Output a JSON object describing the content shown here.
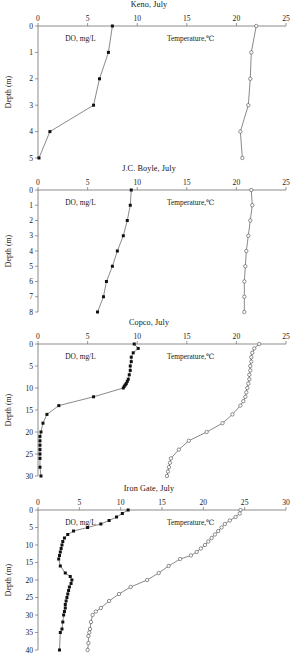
{
  "figure": {
    "series_labels": {
      "do": "DO, mg/L",
      "temperature": "Temperature,℃"
    },
    "y_axis_title": "Depth (m)"
  },
  "chart_data": [
    {
      "type": "line",
      "title": "Keno, July",
      "xlabel": "",
      "ylabel": "Depth (m)",
      "xlim": [
        0,
        25
      ],
      "ylim": [
        0,
        5
      ],
      "xticks": [
        0,
        5,
        10,
        15,
        20,
        25
      ],
      "yticks": [
        0,
        1,
        2,
        3,
        4,
        5
      ],
      "grid": false,
      "legend": "inline",
      "series": [
        {
          "name": "DO, mg/L",
          "marker": "filled-square",
          "x": [
            7.5,
            7.1,
            6.2,
            5.6,
            1.2,
            0.1
          ],
          "y": [
            0,
            1,
            2,
            3,
            4,
            5
          ]
        },
        {
          "name": "Temperature,℃",
          "marker": "open-circle",
          "x": [
            22.0,
            21.5,
            21.4,
            21.2,
            20.4,
            20.6
          ],
          "y": [
            0,
            1,
            2,
            3,
            4,
            5
          ]
        }
      ]
    },
    {
      "type": "line",
      "title": "J.C. Boyle, July",
      "xlabel": "",
      "ylabel": "Depth (m)",
      "xlim": [
        0,
        25
      ],
      "ylim": [
        0,
        8
      ],
      "xticks": [
        0,
        5,
        10,
        15,
        20,
        25
      ],
      "yticks": [
        0,
        1,
        2,
        3,
        4,
        5,
        6,
        7,
        8
      ],
      "grid": false,
      "legend": "inline",
      "series": [
        {
          "name": "DO, mg/L",
          "marker": "filled-square",
          "x": [
            9.4,
            9.3,
            9.0,
            8.6,
            8.0,
            7.5,
            6.9,
            6.6,
            6.0
          ],
          "y": [
            0,
            1,
            2,
            3,
            4,
            5,
            6,
            7,
            8
          ]
        },
        {
          "name": "Temperature,℃",
          "marker": "open-circle",
          "x": [
            21.5,
            21.6,
            21.4,
            21.2,
            21.0,
            20.9,
            20.8,
            20.8,
            20.8
          ],
          "y": [
            0,
            1,
            2,
            3,
            4,
            5,
            6,
            7,
            8
          ]
        }
      ]
    },
    {
      "type": "line",
      "title": "Copco, July",
      "xlabel": "",
      "ylabel": "Depth (m)",
      "xlim": [
        0,
        25
      ],
      "ylim": [
        0,
        30
      ],
      "xticks": [
        0,
        5,
        10,
        15,
        20,
        25
      ],
      "yticks": [
        0,
        5,
        10,
        15,
        20,
        25,
        30
      ],
      "grid": false,
      "legend": "inline",
      "series": [
        {
          "name": "DO, mg/L",
          "marker": "filled-square",
          "x": [
            9.7,
            10.1,
            9.6,
            9.4,
            9.4,
            9.3,
            9.3,
            9.2,
            9.1,
            9.0,
            8.9,
            8.8,
            8.7,
            8.6,
            5.6,
            2.1,
            0.9,
            0.5,
            0.3,
            0.2,
            0.2,
            0.2,
            0.2,
            0.2,
            0.2,
            0.2,
            0.3
          ],
          "y": [
            0,
            1,
            2,
            3,
            4,
            5,
            6,
            7,
            8,
            8.5,
            9,
            9.3,
            9.6,
            10,
            12,
            14,
            16,
            18,
            20,
            21,
            22,
            23,
            24,
            25,
            26,
            28,
            30
          ]
        },
        {
          "name": "Temperature,℃",
          "marker": "open-circle",
          "x": [
            22.3,
            21.8,
            21.6,
            21.5,
            21.5,
            21.4,
            21.4,
            21.3,
            21.3,
            21.2,
            21.1,
            21.0,
            20.9,
            20.7,
            20.4,
            19.6,
            18.6,
            17.0,
            15.2,
            14.2,
            13.4,
            13.3,
            13.2,
            13.1,
            13.0
          ],
          "y": [
            0,
            1,
            2,
            3,
            4,
            5,
            6,
            7,
            8,
            9,
            10,
            11,
            12,
            13,
            14,
            16,
            18,
            20,
            22,
            24,
            26,
            27,
            28,
            29,
            30
          ]
        }
      ]
    },
    {
      "type": "line",
      "title": "Iron Gate, July",
      "xlabel": "",
      "ylabel": "Depth (m)",
      "xlim": [
        0,
        30
      ],
      "ylim": [
        0,
        40
      ],
      "xticks": [
        0,
        5,
        10,
        15,
        20,
        25,
        30
      ],
      "yticks": [
        0,
        5,
        10,
        15,
        20,
        25,
        30,
        35,
        40
      ],
      "grid": false,
      "legend": "inline",
      "series": [
        {
          "name": "DO, mg/L",
          "marker": "filled-square",
          "x": [
            10.9,
            10.2,
            9.5,
            8.6,
            7.6,
            6.0,
            4.3,
            3.6,
            3.2,
            3.0,
            2.9,
            2.8,
            2.7,
            2.6,
            2.5,
            2.7,
            3.3,
            3.9,
            4.1,
            4.0,
            3.8,
            3.7,
            3.6,
            3.5,
            3.4,
            3.3,
            3.3,
            3.2,
            3.1,
            3.0,
            2.9,
            2.7,
            2.6
          ],
          "y": [
            0,
            1,
            2,
            3,
            4,
            5,
            6,
            7,
            8,
            9,
            10,
            11,
            12,
            13,
            14,
            16,
            18,
            19,
            20,
            21,
            22,
            23,
            24,
            25,
            26,
            27,
            28,
            29,
            30,
            32,
            34,
            35,
            40
          ]
        },
        {
          "name": "Temperature,℃",
          "marker": "open-circle",
          "x": [
            24.5,
            24.4,
            23.9,
            23.2,
            22.6,
            22.2,
            21.8,
            21.4,
            21.0,
            20.6,
            20.2,
            19.7,
            19.2,
            18.5,
            17.2,
            15.8,
            14.6,
            13.2,
            11.2,
            9.8,
            8.6,
            7.6,
            7.0,
            6.6,
            6.4,
            6.3,
            6.2,
            6.1,
            6.1,
            6.0
          ],
          "y": [
            0,
            1,
            2,
            3,
            4,
            5,
            6,
            7,
            8,
            9,
            10,
            11,
            12,
            13,
            14,
            16,
            18,
            20,
            22,
            24,
            26,
            28,
            29,
            30,
            32,
            34,
            35,
            36,
            38,
            40
          ]
        }
      ]
    }
  ]
}
